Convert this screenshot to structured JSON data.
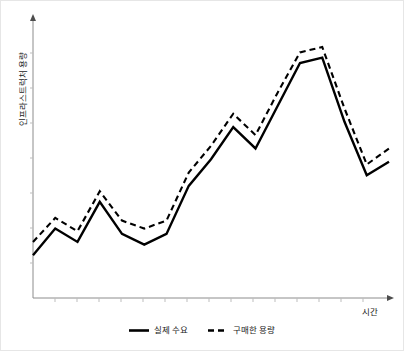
{
  "chart_data": {
    "type": "line",
    "title": "",
    "xlabel": "시간",
    "ylabel": "인프라스트럭처 용량",
    "grid": false,
    "legend_position": "bottom-center",
    "xlim": [
      0,
      16
    ],
    "ylim": [
      0,
      10
    ],
    "x": [
      0,
      1,
      2,
      3,
      4,
      5,
      6,
      7,
      8,
      9,
      10,
      11,
      12,
      13,
      14,
      15,
      16
    ],
    "series": [
      {
        "name": "실제 수요",
        "style": "solid",
        "color": "#000000",
        "values": [
          1.6,
          2.6,
          2.1,
          3.6,
          2.4,
          2.0,
          2.4,
          4.2,
          5.2,
          6.4,
          5.6,
          7.2,
          8.8,
          9.0,
          6.6,
          4.6,
          5.1
        ]
      },
      {
        "name": "구매한 용량",
        "style": "dashed",
        "color": "#000000",
        "values": [
          2.1,
          3.0,
          2.5,
          4.0,
          2.9,
          2.6,
          2.9,
          4.7,
          5.7,
          6.9,
          6.1,
          7.7,
          9.2,
          9.4,
          7.1,
          5.0,
          5.6
        ]
      }
    ],
    "annotations": []
  },
  "axes": {
    "y_label": "인프라스트럭처 용량",
    "x_label": "시간",
    "y_arrow": "up-arrow-icon",
    "x_arrow": "right-arrow-icon",
    "axis_color": "#8c8c8c",
    "tick_count_x": 16,
    "tick_count_y": 8
  },
  "legend": {
    "items": [
      {
        "label": "실제 수요",
        "style": "solid",
        "swatch": "solid-line-swatch"
      },
      {
        "label": "구매한 용량",
        "style": "dashed",
        "swatch": "dashed-line-swatch"
      }
    ]
  },
  "figure": {
    "background": "#ffffff",
    "border_color": "#e6e6e6",
    "line_color": "#000000"
  }
}
